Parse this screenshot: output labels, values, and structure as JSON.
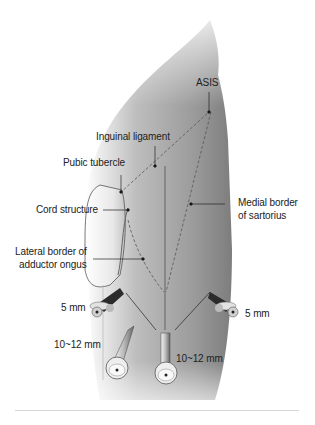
{
  "figure": {
    "landmarks": {
      "asis": "ASIS",
      "inguinal_ligament": "Inguinal ligament",
      "pubic_tubercle": "Pubic tubercle",
      "cord_structure": "Cord structure",
      "medial_border_line1": "Medial border",
      "medial_border_line2": "of sartorius",
      "lateral_border_line1": "Lateral border of",
      "lateral_border_line2": "adductor ongus"
    },
    "ports": [
      {
        "id": "left-5mm",
        "label": "5 mm"
      },
      {
        "id": "right-5mm",
        "label": "5 mm"
      },
      {
        "id": "left-10-12mm",
        "label": "10~12 mm"
      },
      {
        "id": "center-10-12mm",
        "label": "10~12 mm"
      }
    ],
    "colors": {
      "skin_dark": "#8a8a8a",
      "skin_light": "#f2f2f2",
      "line": "#333333",
      "dashed": "#555555"
    }
  }
}
